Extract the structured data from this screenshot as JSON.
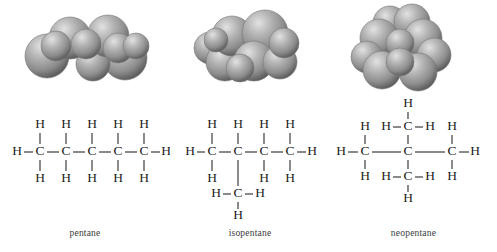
{
  "figure": {
    "background": "#ffffff",
    "bond_color": "#2b2b2b",
    "atom_color": "#1c1c1c",
    "caption_color": "#3b3b3b",
    "model_sphere_color": "#9a9a9a",
    "model_sphere_highlight": "#d8d8d8",
    "model_sphere_shadow": "#5e5e5e"
  },
  "panels": [
    {
      "id": "pentane",
      "caption": "pentane",
      "model": {
        "name": "space-filling-model-pentane",
        "description": "space-filling model of a straight chain of five carbons",
        "sphere_count": 9
      },
      "formula": {
        "name": "structural-formula-pentane",
        "carbon_count": 5,
        "hydrogen_count": 12,
        "atoms": [
          {
            "label": "C",
            "x": 40,
            "y": 57
          },
          {
            "label": "C",
            "x": 66,
            "y": 57
          },
          {
            "label": "C",
            "x": 92,
            "y": 57
          },
          {
            "label": "C",
            "x": 118,
            "y": 57
          },
          {
            "label": "C",
            "x": 144,
            "y": 57
          },
          {
            "label": "H",
            "x": 17,
            "y": 57
          },
          {
            "label": "H",
            "x": 166,
            "y": 57
          },
          {
            "label": "H",
            "x": 40,
            "y": 30
          },
          {
            "label": "H",
            "x": 66,
            "y": 30
          },
          {
            "label": "H",
            "x": 92,
            "y": 30
          },
          {
            "label": "H",
            "x": 118,
            "y": 30
          },
          {
            "label": "H",
            "x": 144,
            "y": 30
          },
          {
            "label": "H",
            "x": 40,
            "y": 84
          },
          {
            "label": "H",
            "x": 66,
            "y": 84
          },
          {
            "label": "H",
            "x": 92,
            "y": 84
          },
          {
            "label": "H",
            "x": 118,
            "y": 84
          },
          {
            "label": "H",
            "x": 144,
            "y": 84
          }
        ],
        "bonds": [
          {
            "x1": 24,
            "y1": 57,
            "x2": 33,
            "y2": 57
          },
          {
            "x1": 47,
            "y1": 57,
            "x2": 59,
            "y2": 57
          },
          {
            "x1": 73,
            "y1": 57,
            "x2": 85,
            "y2": 57
          },
          {
            "x1": 99,
            "y1": 57,
            "x2": 111,
            "y2": 57
          },
          {
            "x1": 125,
            "y1": 57,
            "x2": 137,
            "y2": 57
          },
          {
            "x1": 151,
            "y1": 57,
            "x2": 160,
            "y2": 57
          },
          {
            "x1": 40,
            "y1": 38,
            "x2": 40,
            "y2": 49
          },
          {
            "x1": 66,
            "y1": 38,
            "x2": 66,
            "y2": 49
          },
          {
            "x1": 92,
            "y1": 38,
            "x2": 92,
            "y2": 49
          },
          {
            "x1": 118,
            "y1": 38,
            "x2": 118,
            "y2": 49
          },
          {
            "x1": 144,
            "y1": 38,
            "x2": 144,
            "y2": 49
          },
          {
            "x1": 40,
            "y1": 65,
            "x2": 40,
            "y2": 76
          },
          {
            "x1": 66,
            "y1": 65,
            "x2": 66,
            "y2": 76
          },
          {
            "x1": 92,
            "y1": 65,
            "x2": 92,
            "y2": 76
          },
          {
            "x1": 118,
            "y1": 65,
            "x2": 118,
            "y2": 76
          },
          {
            "x1": 144,
            "y1": 65,
            "x2": 144,
            "y2": 76
          }
        ]
      }
    },
    {
      "id": "isopentane",
      "caption": "isopentane",
      "model": {
        "name": "space-filling-model-isopentane",
        "description": "space-filling model of a branched four-carbon chain with one methyl branch",
        "sphere_count": 9
      },
      "formula": {
        "name": "structural-formula-isopentane",
        "carbon_count": 5,
        "hydrogen_count": 12,
        "atoms": [
          {
            "label": "C",
            "x": 42,
            "y": 57
          },
          {
            "label": "C",
            "x": 68,
            "y": 57
          },
          {
            "label": "C",
            "x": 94,
            "y": 57
          },
          {
            "label": "C",
            "x": 120,
            "y": 57
          },
          {
            "label": "C",
            "x": 68,
            "y": 99
          },
          {
            "label": "H",
            "x": 20,
            "y": 57
          },
          {
            "label": "H",
            "x": 142,
            "y": 57
          },
          {
            "label": "H",
            "x": 42,
            "y": 30
          },
          {
            "label": "H",
            "x": 68,
            "y": 30
          },
          {
            "label": "H",
            "x": 94,
            "y": 30
          },
          {
            "label": "H",
            "x": 120,
            "y": 30
          },
          {
            "label": "H",
            "x": 42,
            "y": 84
          },
          {
            "label": "H",
            "x": 94,
            "y": 84
          },
          {
            "label": "H",
            "x": 120,
            "y": 84
          },
          {
            "label": "H",
            "x": 46,
            "y": 99
          },
          {
            "label": "H",
            "x": 90,
            "y": 99
          },
          {
            "label": "H",
            "x": 68,
            "y": 121
          }
        ],
        "bonds": [
          {
            "x1": 27,
            "y1": 57,
            "x2": 35,
            "y2": 57
          },
          {
            "x1": 49,
            "y1": 57,
            "x2": 61,
            "y2": 57
          },
          {
            "x1": 75,
            "y1": 57,
            "x2": 87,
            "y2": 57
          },
          {
            "x1": 101,
            "y1": 57,
            "x2": 113,
            "y2": 57
          },
          {
            "x1": 127,
            "y1": 57,
            "x2": 136,
            "y2": 57
          },
          {
            "x1": 42,
            "y1": 38,
            "x2": 42,
            "y2": 49
          },
          {
            "x1": 68,
            "y1": 38,
            "x2": 68,
            "y2": 49
          },
          {
            "x1": 94,
            "y1": 38,
            "x2": 94,
            "y2": 49
          },
          {
            "x1": 120,
            "y1": 38,
            "x2": 120,
            "y2": 49
          },
          {
            "x1": 42,
            "y1": 65,
            "x2": 42,
            "y2": 76
          },
          {
            "x1": 94,
            "y1": 65,
            "x2": 94,
            "y2": 76
          },
          {
            "x1": 120,
            "y1": 65,
            "x2": 120,
            "y2": 76
          },
          {
            "x1": 68,
            "y1": 65,
            "x2": 68,
            "y2": 91
          },
          {
            "x1": 53,
            "y1": 99,
            "x2": 61,
            "y2": 99
          },
          {
            "x1": 75,
            "y1": 99,
            "x2": 83,
            "y2": 99
          },
          {
            "x1": 68,
            "y1": 107,
            "x2": 68,
            "y2": 114
          }
        ]
      }
    },
    {
      "id": "neopentane",
      "caption": "neopentane",
      "model": {
        "name": "space-filling-model-neopentane",
        "description": "space-filling model of a central carbon surrounded by four methyl groups",
        "sphere_count": 10
      },
      "formula": {
        "name": "structural-formula-neopentane",
        "carbon_count": 5,
        "hydrogen_count": 12,
        "atoms": [
          {
            "label": "C",
            "x": 35,
            "y": 57
          },
          {
            "label": "C",
            "x": 78,
            "y": 57
          },
          {
            "label": "C",
            "x": 122,
            "y": 57
          },
          {
            "label": "C",
            "x": 78,
            "y": 32
          },
          {
            "label": "C",
            "x": 78,
            "y": 82
          },
          {
            "label": "H",
            "x": 11,
            "y": 57
          },
          {
            "label": "H",
            "x": 145,
            "y": 57
          },
          {
            "label": "H",
            "x": 35,
            "y": 32
          },
          {
            "label": "H",
            "x": 35,
            "y": 82
          },
          {
            "label": "H",
            "x": 122,
            "y": 32
          },
          {
            "label": "H",
            "x": 122,
            "y": 82
          },
          {
            "label": "H",
            "x": 56,
            "y": 32
          },
          {
            "label": "H",
            "x": 100,
            "y": 32
          },
          {
            "label": "H",
            "x": 78,
            "y": 9
          },
          {
            "label": "H",
            "x": 56,
            "y": 82
          },
          {
            "label": "H",
            "x": 100,
            "y": 82
          },
          {
            "label": "H",
            "x": 78,
            "y": 104
          }
        ],
        "bonds": [
          {
            "x1": 18,
            "y1": 57,
            "x2": 28,
            "y2": 57
          },
          {
            "x1": 42,
            "y1": 57,
            "x2": 71,
            "y2": 57
          },
          {
            "x1": 85,
            "y1": 57,
            "x2": 115,
            "y2": 57
          },
          {
            "x1": 129,
            "y1": 57,
            "x2": 139,
            "y2": 57
          },
          {
            "x1": 35,
            "y1": 40,
            "x2": 35,
            "y2": 49
          },
          {
            "x1": 35,
            "y1": 65,
            "x2": 35,
            "y2": 74
          },
          {
            "x1": 122,
            "y1": 40,
            "x2": 122,
            "y2": 49
          },
          {
            "x1": 122,
            "y1": 65,
            "x2": 122,
            "y2": 74
          },
          {
            "x1": 78,
            "y1": 40,
            "x2": 78,
            "y2": 49
          },
          {
            "x1": 78,
            "y1": 65,
            "x2": 78,
            "y2": 74
          },
          {
            "x1": 63,
            "y1": 32,
            "x2": 71,
            "y2": 32
          },
          {
            "x1": 85,
            "y1": 32,
            "x2": 93,
            "y2": 32
          },
          {
            "x1": 78,
            "y1": 17,
            "x2": 78,
            "y2": 24
          },
          {
            "x1": 63,
            "y1": 82,
            "x2": 71,
            "y2": 82
          },
          {
            "x1": 85,
            "y1": 82,
            "x2": 93,
            "y2": 82
          },
          {
            "x1": 78,
            "y1": 90,
            "x2": 78,
            "y2": 97
          }
        ]
      }
    }
  ]
}
